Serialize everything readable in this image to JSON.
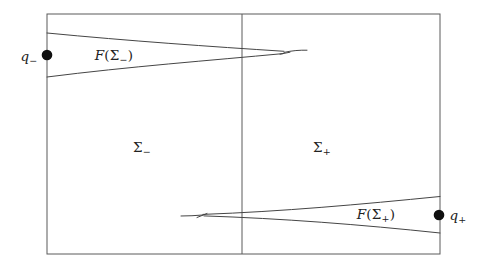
{
  "figure": {
    "labels": {
      "q_minus": {
        "base": "q",
        "sub": "−"
      },
      "f_sigma_minus": {
        "f": "F",
        "open": "(Σ",
        "sub": "−",
        "close": ")"
      },
      "sigma_minus": {
        "base": "Σ",
        "sub": "−"
      },
      "sigma_plus": {
        "base": "Σ",
        "sub": "+"
      },
      "f_sigma_plus": {
        "f": "F",
        "open": "(Σ",
        "sub": "+",
        "close": ")"
      },
      "q_plus": {
        "base": "q",
        "sub": "+"
      }
    },
    "colors": {
      "bg": "#ffffff",
      "line": "#5a5a5a",
      "curve": "#454545",
      "dot": "#101010",
      "text": "#222222"
    }
  }
}
